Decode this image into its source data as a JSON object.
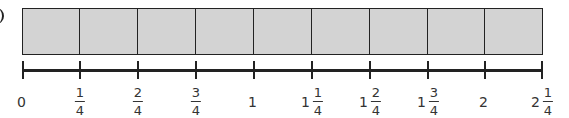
{
  "diagram": {
    "bar": {
      "cells": 9,
      "fill_color": "#d3d3d3",
      "border_color": "#222222"
    },
    "number_line": {
      "ticks": [
        {
          "x": 23,
          "whole": "0",
          "num": "",
          "den": ""
        },
        {
          "x": 80,
          "whole": "",
          "num": "1",
          "den": "4"
        },
        {
          "x": 138,
          "whole": "",
          "num": "2",
          "den": "4"
        },
        {
          "x": 196,
          "whole": "",
          "num": "3",
          "den": "4"
        },
        {
          "x": 254,
          "whole": "1",
          "num": "",
          "den": ""
        },
        {
          "x": 312,
          "whole": "1",
          "num": "1",
          "den": "4"
        },
        {
          "x": 370,
          "whole": "1",
          "num": "2",
          "den": "4"
        },
        {
          "x": 428,
          "whole": "1",
          "num": "3",
          "den": "4"
        },
        {
          "x": 485,
          "whole": "2",
          "num": "",
          "den": ""
        },
        {
          "x": 542,
          "whole": "2",
          "num": "1",
          "den": "4"
        }
      ]
    }
  }
}
